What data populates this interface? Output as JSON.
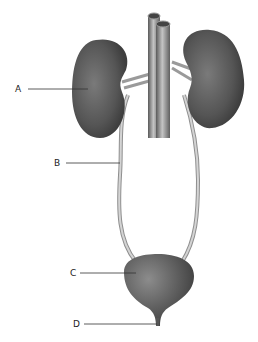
{
  "diagram": {
    "type": "anatomy",
    "structures": [
      "left kidney",
      "right kidney",
      "aorta",
      "inferior vena cava",
      "renal vessels",
      "left ureter",
      "right ureter",
      "urinary bladder",
      "urethra"
    ],
    "labels": [
      {
        "id": "A",
        "text": "A",
        "points_to": "kidney"
      },
      {
        "id": "B",
        "text": "B",
        "points_to": "ureter"
      },
      {
        "id": "C",
        "text": "C",
        "points_to": "bladder"
      },
      {
        "id": "D",
        "text": "D",
        "points_to": "urethra"
      }
    ],
    "colors": {
      "organ": "#555555",
      "organ_highlight": "#8a8a8a",
      "vessel": "#6e6e6e",
      "vessel_highlight": "#bdbdbd",
      "ureter": "#b5b5b5",
      "leader_line": "#333333",
      "background": "#ffffff"
    }
  }
}
